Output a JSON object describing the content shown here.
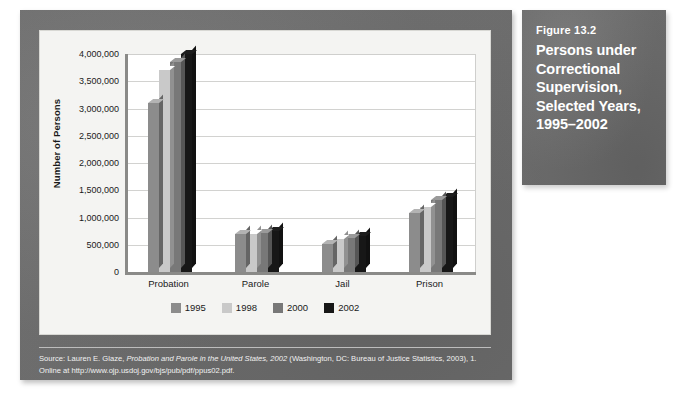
{
  "caption": {
    "figure_number": "Figure 13.2",
    "title": "Persons under Correctional Supervision, Selected Years, 1995–2002"
  },
  "source_note": {
    "line1_prefix": "Source: Lauren E. Glaze, ",
    "line1_italic": "Probation and Parole in the United States, 2002",
    "line1_suffix": " (Washington, DC: Bureau of Justice Statistics, 2003), 1.",
    "line2": "Online at http://www.ojp.usdoj.gov/bjs/pub/pdf/ppus02.pdf."
  },
  "chart_data": {
    "type": "bar",
    "title": "Persons under Correctional Supervision, Selected Years, 1995–2002",
    "xlabel": "",
    "ylabel": "Number of Persons",
    "ylim": [
      0,
      4000000
    ],
    "grid": true,
    "legend_position": "bottom",
    "categories": [
      "Probation",
      "Parole",
      "Jail",
      "Prison"
    ],
    "ytick_labels": [
      "4,000,000",
      "3,500,000",
      "3,000,000",
      "2,500,000",
      "2,000,000",
      "1,500,000",
      "1,000,000",
      "500,000",
      "0"
    ],
    "ytick_values": [
      4000000,
      3500000,
      3000000,
      2500000,
      2000000,
      1500000,
      1000000,
      500000,
      0
    ],
    "series": [
      {
        "name": "1995",
        "color": "#8c8c8c",
        "values": [
          3100000,
          700000,
          510000,
          1080000
        ]
      },
      {
        "name": "1998",
        "color": "#c9c9c9",
        "values": [
          3700000,
          700000,
          600000,
          1200000
        ]
      },
      {
        "name": "2000",
        "color": "#787878",
        "values": [
          3850000,
          720000,
          620000,
          1320000
        ]
      },
      {
        "name": "2002",
        "color": "#171717",
        "values": [
          4000000,
          750000,
          660000,
          1370000
        ]
      }
    ]
  }
}
